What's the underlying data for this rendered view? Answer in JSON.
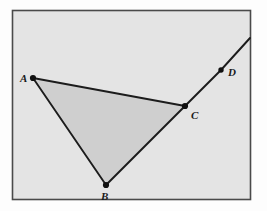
{
  "figure": {
    "canvas": {
      "width": 267,
      "height": 211
    },
    "frame": {
      "name": "diagram-frame",
      "x": 12.5,
      "y": 10.5,
      "width": 238,
      "height": 189,
      "fill": "#e4e4e4",
      "stroke": "#4a4a4a",
      "stroke_width": 1.6
    },
    "colors": {
      "page_background": "#fdfdfd",
      "frame_background": "#e4e4e4",
      "frame_border": "#4a4a4a",
      "triangle_fill": "#cfcfcf",
      "line_stroke": "#1c1c1c",
      "point_fill": "#101010",
      "label_color": "#1a1a1a"
    },
    "points": [
      {
        "id": "A",
        "label": "A",
        "x": 33,
        "y": 78,
        "r": 3.1,
        "label_x": 20,
        "label_y": 82
      },
      {
        "id": "B",
        "label": "B",
        "x": 106,
        "y": 185,
        "r": 3.1,
        "label_x": 101,
        "label_y": 200
      },
      {
        "id": "C",
        "label": "C",
        "x": 185,
        "y": 106,
        "r": 3.1,
        "label_x": 191,
        "label_y": 119
      },
      {
        "id": "D",
        "label": "D",
        "x": 221,
        "y": 70,
        "r": 2.7,
        "label_x": 228,
        "label_y": 76
      }
    ],
    "triangle": {
      "name": "triangle-abc",
      "vertices": "33,78 106,185 185,106",
      "fill": "#cfcfcf"
    },
    "segments": [
      {
        "id": "AC",
        "name": "segment-a-c",
        "x1": 33,
        "y1": 78,
        "x2": 185,
        "y2": 106,
        "width": 1.9
      },
      {
        "id": "AB",
        "name": "segment-a-b",
        "x1": 33,
        "y1": 78,
        "x2": 106,
        "y2": 185,
        "width": 1.9
      },
      {
        "id": "BC",
        "name": "segment-b-c",
        "x1": 106,
        "y1": 185,
        "x2": 185,
        "y2": 106,
        "width": 1.9
      },
      {
        "id": "CD",
        "name": "segment-c-d",
        "x1": 185,
        "y1": 106,
        "x2": 221,
        "y2": 70,
        "width": 1.9
      },
      {
        "id": "D-ext",
        "name": "ray-beyond-d",
        "x1": 221,
        "y1": 70,
        "x2": 250,
        "y2": 38,
        "width": 1.9
      }
    ]
  }
}
